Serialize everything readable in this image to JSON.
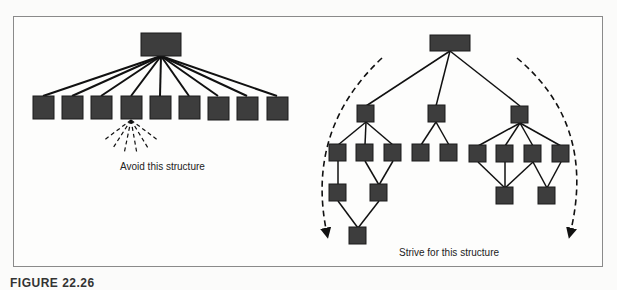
{
  "figure": {
    "caption_partial": "FIGURE 22.26",
    "colors": {
      "node_fill": "#3d3d3d",
      "node_stroke": "#1a1a1a",
      "edge": "#111111",
      "frame": "#8a8a8a"
    }
  },
  "left_diagram": {
    "label": "Avoid this structure",
    "structure": "wide-flat",
    "root_count": 1,
    "children_count": 9,
    "fanout_hint": "dashed lines from 4th child indicating further wide fan-out"
  },
  "right_diagram": {
    "label": "Strive for this structure",
    "structure": "deep-narrow",
    "levels": [
      {
        "level": 0,
        "nodes": 1
      },
      {
        "level": 1,
        "nodes": 3
      },
      {
        "level": 2,
        "nodes": 9
      },
      {
        "level": 3,
        "nodes": 4
      },
      {
        "level": 4,
        "nodes": 1
      }
    ],
    "arcs": [
      "dashed-arrow-left",
      "dashed-arrow-right"
    ]
  }
}
